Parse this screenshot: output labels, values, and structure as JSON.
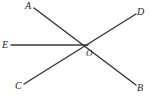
{
  "figure": {
    "kind": "geometry-line-diagram",
    "width": 149,
    "height": 97,
    "background_color": "#ffffff",
    "line_color": "#333333",
    "label_color": "#1c1c1c"
  },
  "labels": {
    "a": "A",
    "b": "B",
    "c": "C",
    "d": "D",
    "e": "E",
    "o": "O"
  },
  "points": {
    "A": {
      "x": 34,
      "y": 8
    },
    "B": {
      "x": 136,
      "y": 85
    },
    "C": {
      "x": 24,
      "y": 84
    },
    "D": {
      "x": 136,
      "y": 14
    },
    "E": {
      "x": 11,
      "y": 45
    },
    "O": {
      "x": 88,
      "y": 45
    }
  },
  "segments": [
    {
      "name": "segment-AB",
      "from": "A",
      "to": "B",
      "stroke": "#333333",
      "width": 1.4
    },
    {
      "name": "segment-CD",
      "from": "C",
      "to": "D",
      "stroke": "#333333",
      "width": 1.4
    },
    {
      "name": "segment-EO",
      "from": "E",
      "to": "O",
      "stroke": "#3a3a3a",
      "width": 1.3
    }
  ]
}
